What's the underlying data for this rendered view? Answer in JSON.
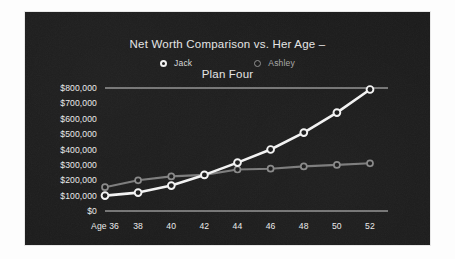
{
  "chart_data": {
    "type": "line",
    "title": "Net Worth Comparison vs.  Her Age –\nPlan Four",
    "title_line1": "Net Worth Comparison vs.  Her Age –",
    "title_line2": "Plan Four",
    "xlabel": "",
    "ylabel": "",
    "x": [
      36,
      38,
      40,
      42,
      44,
      46,
      48,
      50,
      52
    ],
    "categories": [
      "Age 36",
      "38",
      "40",
      "42",
      "44",
      "46",
      "48",
      "50",
      "52"
    ],
    "xtick_labels": [
      "Age 36",
      "38",
      "40",
      "42",
      "44",
      "46",
      "48",
      "50",
      "52"
    ],
    "ytick_labels": [
      "$800,000",
      "$700,000",
      "$600,000",
      "$500,000",
      "$400,000",
      "$300,000",
      "$200,000",
      "$100,000",
      "$0"
    ],
    "ytick_values": [
      800000,
      700000,
      600000,
      500000,
      400000,
      300000,
      200000,
      100000,
      0
    ],
    "ylim": [
      0,
      800000
    ],
    "xlim": [
      36,
      52
    ],
    "grid": false,
    "legend_position": "top-center",
    "series": [
      {
        "name": "Jack",
        "color": "#f4f4f4",
        "values": [
          100000,
          120000,
          165000,
          235000,
          315000,
          400000,
          510000,
          640000,
          790000
        ]
      },
      {
        "name": "Ashley",
        "color": "#7d7d7d",
        "values": [
          155000,
          200000,
          225000,
          235000,
          270000,
          275000,
          290000,
          300000,
          310000
        ]
      }
    ]
  },
  "legend": {
    "items": [
      {
        "label": "Jack",
        "marker": "circle-marker-jack"
      },
      {
        "label": "Ashley",
        "marker": "circle-marker-ashley"
      }
    ]
  },
  "colors": {
    "panel_background": "#1b1b1b",
    "page_background": "#fdfdfd",
    "jack": "#f4f4f4",
    "ashley": "#7d7d7d",
    "axis": "#cfcfcf",
    "text": "#ececec"
  }
}
